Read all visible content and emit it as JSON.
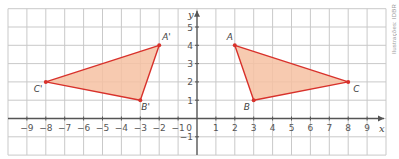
{
  "figure": {
    "watermark": "Ilustrações: IDBR",
    "axis_labels": {
      "x": "x",
      "y": "y"
    },
    "origin_label": "0",
    "x_ticks": [
      "−9",
      "−8",
      "−7",
      "−6",
      "−5",
      "−4",
      "−3",
      "−2",
      "−1",
      "1",
      "2",
      "3",
      "4",
      "5",
      "6",
      "7",
      "8",
      "9"
    ],
    "y_ticks": [
      "5",
      "4",
      "3",
      "2",
      "1",
      "−1"
    ],
    "colors": {
      "fill": "#f6c1a2",
      "edge": "#d8312b",
      "grid": "#c9c9c9",
      "axis": "#555555"
    },
    "triangles": [
      {
        "name": "ABC",
        "points": [
          {
            "label": "A",
            "x": 2,
            "y": 4
          },
          {
            "label": "B",
            "x": 3,
            "y": 1
          },
          {
            "label": "C",
            "x": 8,
            "y": 2
          }
        ]
      },
      {
        "name": "A'B'C'",
        "points": [
          {
            "label": "A'",
            "x": -2,
            "y": 4
          },
          {
            "label": "B'",
            "x": -3,
            "y": 1
          },
          {
            "label": "C'",
            "x": -8,
            "y": 2
          }
        ]
      }
    ]
  },
  "chart_data": {
    "type": "scatter",
    "title": "",
    "xlabel": "x",
    "ylabel": "y",
    "xlim": [
      -10,
      10
    ],
    "ylim": [
      -2,
      6
    ],
    "grid": true,
    "series": [
      {
        "name": "Triangle ABC",
        "points": [
          [
            2,
            4
          ],
          [
            3,
            1
          ],
          [
            8,
            2
          ]
        ],
        "labels": [
          "A",
          "B",
          "C"
        ]
      },
      {
        "name": "Triangle A'B'C'",
        "points": [
          [
            -2,
            4
          ],
          [
            -3,
            1
          ],
          [
            -8,
            2
          ]
        ],
        "labels": [
          "A'",
          "B'",
          "C'"
        ]
      }
    ]
  }
}
